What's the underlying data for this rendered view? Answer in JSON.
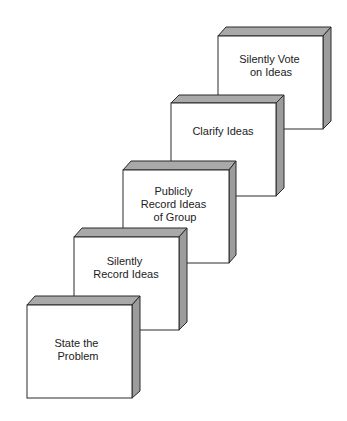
{
  "diagram": {
    "title": "",
    "colors": {
      "face": "#ffffff",
      "top": "#a9a9a9",
      "side": "#9c9c9c",
      "stroke": "#2a2a2a",
      "text": "#222222"
    },
    "steps": [
      {
        "order": 1,
        "lines": [
          "State the",
          "Problem"
        ]
      },
      {
        "order": 2,
        "lines": [
          "Silently",
          "Record Ideas"
        ]
      },
      {
        "order": 3,
        "lines": [
          "Publicly",
          "Record Ideas",
          "of Group"
        ]
      },
      {
        "order": 4,
        "lines": [
          "Clarify Ideas"
        ]
      },
      {
        "order": 5,
        "lines": [
          "Silently Vote",
          "on Ideas"
        ]
      }
    ]
  }
}
